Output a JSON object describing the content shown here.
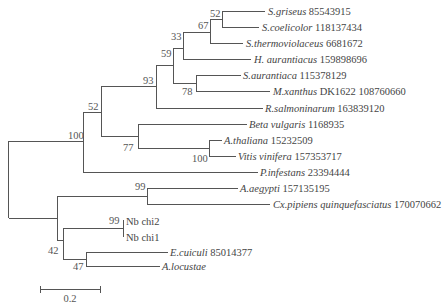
{
  "figure": {
    "type": "phylogenetic-tree",
    "scale_bar": {
      "label": "0.2",
      "x1": 40,
      "x2": 100,
      "y": 289
    }
  },
  "taxa": [
    {
      "id": "sgriseus",
      "species": "S.griseus",
      "accession": "85543915",
      "y": 11,
      "tip_x": 265
    },
    {
      "id": "scoelicolor",
      "species": "S.coelicolor",
      "accession": "118137434",
      "y": 27,
      "tip_x": 259
    },
    {
      "id": "sthermo",
      "species": "S.thermoviolaceus",
      "accession": "6681672",
      "y": 43,
      "tip_x": 243
    },
    {
      "id": "haur",
      "species": "H. aurantiacus",
      "accession": "159898696",
      "y": 59,
      "tip_x": 251
    },
    {
      "id": "saur",
      "species": "S.aurantiaca",
      "accession": "115378129",
      "y": 75,
      "tip_x": 241
    },
    {
      "id": "mxanthus",
      "species": "M.xanthus",
      "accession": "DK1622 108760660",
      "y": 91,
      "tip_x": 270
    },
    {
      "id": "rsalm",
      "species": "R.salmoninarum",
      "accession": "163839120",
      "y": 108,
      "tip_x": 263
    },
    {
      "id": "beta",
      "species": "Beta vulgaris",
      "accession": "1168935",
      "y": 124,
      "tip_x": 247
    },
    {
      "id": "athal",
      "species": "A.thaliana",
      "accession": "15232509",
      "y": 140,
      "tip_x": 222
    },
    {
      "id": "vitis",
      "species": "Vitis vinifera",
      "accession": "157353717",
      "y": 156,
      "tip_x": 236
    },
    {
      "id": "pinf",
      "species": "P.infestans",
      "accession": "23394444",
      "y": 172,
      "tip_x": 258
    },
    {
      "id": "aaeg",
      "species": "A.aegypti",
      "accession": "157135195",
      "y": 188,
      "tip_x": 238
    },
    {
      "id": "cxpip",
      "species": "Cx.pipiens quinquefasciatus",
      "accession": "170070662",
      "y": 204,
      "tip_x": 270
    },
    {
      "id": "nbchi2",
      "species": "",
      "accession": "Nb chi2",
      "y": 221,
      "tip_x": 124
    },
    {
      "id": "nbchi1",
      "species": "",
      "accession": "Nb chi1",
      "y": 237,
      "tip_x": 124
    },
    {
      "id": "ecuic",
      "species": "E.cuiculi",
      "accession": "85014377",
      "y": 252,
      "tip_x": 168
    },
    {
      "id": "aloc",
      "species": "A.locustae",
      "accession": "",
      "y": 266,
      "tip_x": 160
    }
  ],
  "bootstrap": [
    {
      "value": "52",
      "x": 210,
      "y": 17
    },
    {
      "value": "67",
      "x": 198,
      "y": 29
    },
    {
      "value": "33",
      "x": 171,
      "y": 40
    },
    {
      "value": "59",
      "x": 161,
      "y": 57
    },
    {
      "value": "93",
      "x": 143,
      "y": 84
    },
    {
      "value": "78",
      "x": 182,
      "y": 95
    },
    {
      "value": "52",
      "x": 88,
      "y": 110
    },
    {
      "value": "100",
      "x": 68,
      "y": 139
    },
    {
      "value": "77",
      "x": 123,
      "y": 151
    },
    {
      "value": "100",
      "x": 192,
      "y": 162
    },
    {
      "value": "99",
      "x": 135,
      "y": 190
    },
    {
      "value": "99",
      "x": 109,
      "y": 224
    },
    {
      "value": "42",
      "x": 48,
      "y": 254
    },
    {
      "value": "47",
      "x": 73,
      "y": 270
    }
  ]
}
